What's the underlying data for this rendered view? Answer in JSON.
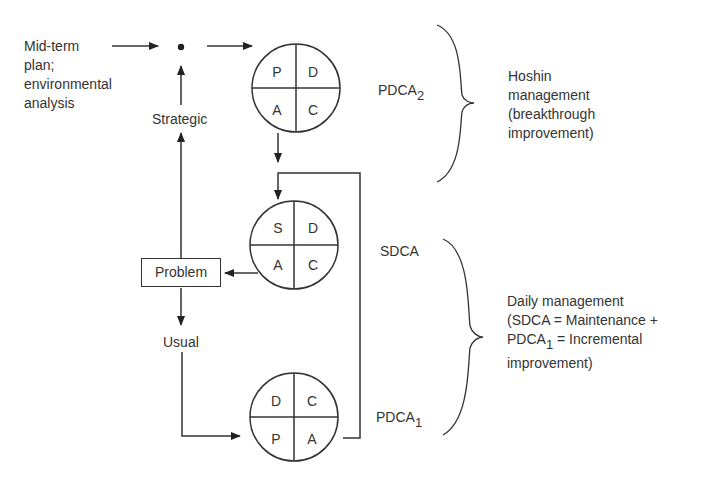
{
  "diagram": {
    "input_label": "Mid-term\nplan;\nenvironmental\nanalysis",
    "strategic_label": "Strategic",
    "usual_label": "Usual",
    "problem_label": "Problem",
    "cycles": [
      {
        "id": "pdca2",
        "name": "PDCA",
        "subscript": "2",
        "quadrants": {
          "top_left": "P",
          "top_right": "D",
          "bottom_left": "A",
          "bottom_right": "C"
        }
      },
      {
        "id": "sdca",
        "name": "SDCA",
        "subscript": "",
        "quadrants": {
          "top_left": "S",
          "top_right": "D",
          "bottom_left": "A",
          "bottom_right": "C"
        }
      },
      {
        "id": "pdca1",
        "name": "PDCA",
        "subscript": "1",
        "quadrants": {
          "top_left": "D",
          "top_right": "C",
          "bottom_left": "P",
          "bottom_right": "A"
        }
      }
    ],
    "groups": [
      {
        "id": "hoshin",
        "lines": [
          "Hoshin",
          "management",
          "(breakthrough",
          "improvement)"
        ]
      },
      {
        "id": "daily",
        "line1": "Daily management",
        "line2": "(SDCA = Maintenance +",
        "line3_prefix": "PDCA",
        "line3_sub": "1",
        "line3_suffix": " = Incremental",
        "line4": "improvement)"
      }
    ]
  }
}
